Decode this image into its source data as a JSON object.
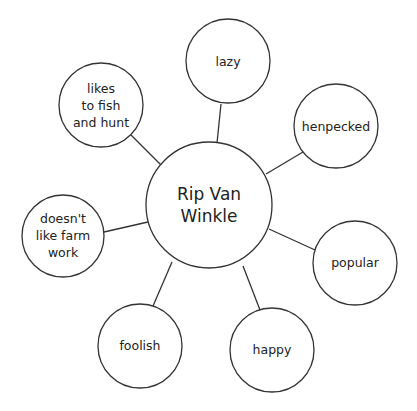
{
  "diagram": {
    "type": "concept-web",
    "center": {
      "lines": [
        "Rip Van",
        "Winkle"
      ]
    },
    "nodes": [
      {
        "id": "lazy",
        "lines": [
          "lazy"
        ]
      },
      {
        "id": "henpecked",
        "lines": [
          "henpecked"
        ]
      },
      {
        "id": "popular",
        "lines": [
          "popular"
        ]
      },
      {
        "id": "happy",
        "lines": [
          "happy"
        ]
      },
      {
        "id": "foolish",
        "lines": [
          "foolish"
        ]
      },
      {
        "id": "doesnt-like-farm-work",
        "lines": [
          "doesn't",
          "like farm",
          "work"
        ]
      },
      {
        "id": "likes-to-fish-and-hunt",
        "lines": [
          "likes",
          "to fish",
          "and hunt"
        ]
      }
    ],
    "colors": {
      "stroke": "#333333",
      "text": "#222222",
      "background": "#ffffff"
    }
  }
}
